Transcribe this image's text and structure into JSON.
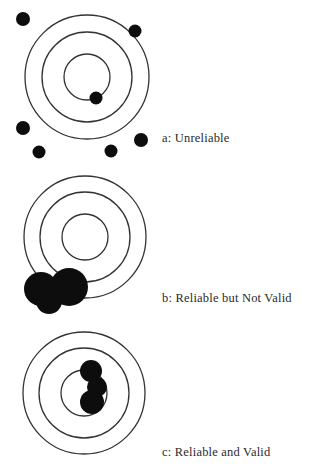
{
  "diagram": {
    "colors": {
      "ring": "#333333",
      "shot": "#0d0d0d",
      "text": "#2a2a2a"
    },
    "targets": [
      {
        "id": "a",
        "label": "a: Unreliable",
        "center": [
          87,
          77
        ],
        "rings": [
          62,
          45,
          23
        ],
        "shots": [
          [
            23,
            19,
            7
          ],
          [
            135,
            31,
            6.5
          ],
          [
            96,
            98,
            6.5
          ],
          [
            23,
            128,
            7
          ],
          [
            39,
            152,
            6.5
          ],
          [
            141,
            140,
            7
          ],
          [
            111,
            151,
            6.5
          ]
        ],
        "label_pos": [
          162,
          131
        ]
      },
      {
        "id": "b",
        "label": "b: Reliable but Not Valid",
        "center": [
          85,
          237
        ],
        "rings": [
          61,
          45,
          23
        ],
        "shots": [
          [
            41,
            289,
            17
          ],
          [
            69,
            287,
            19
          ],
          [
            49,
            301,
            13
          ]
        ],
        "label_pos": [
          162,
          291
        ]
      },
      {
        "id": "c",
        "label": "c: Reliable and Valid",
        "center": [
          84,
          393
        ],
        "rings": [
          61,
          45,
          23
        ],
        "shots": [
          [
            91,
            371,
            11
          ],
          [
            97,
            387,
            10
          ],
          [
            92,
            402,
            12
          ]
        ],
        "label_pos": [
          162,
          445
        ]
      }
    ]
  }
}
